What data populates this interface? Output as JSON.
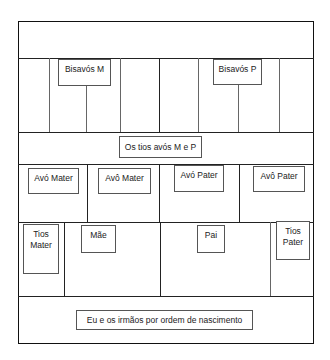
{
  "diagram": {
    "title_band": "",
    "great_grandparents": {
      "maternal": "Bisavós M",
      "paternal": "Bisavós P"
    },
    "great_uncles_aunts": "Os tios avós M e P",
    "grandparents": {
      "maternal_1": "Avó Mater",
      "maternal_2": "Avô Mater",
      "paternal_1": "Avó Pater",
      "paternal_2": "Avô Pater"
    },
    "parents": {
      "uncles_maternal_line1": "Tios",
      "uncles_maternal_line2": "Mater",
      "mother": "Mãe",
      "father": "Pai",
      "uncles_paternal_line1": "Tios",
      "uncles_paternal_line2": "Pater"
    },
    "self_and_siblings": "Eu e os irmãos por ordem de nascimento"
  },
  "colors": {
    "line": "#222222",
    "box_border": "#555555",
    "background": "#ffffff"
  }
}
